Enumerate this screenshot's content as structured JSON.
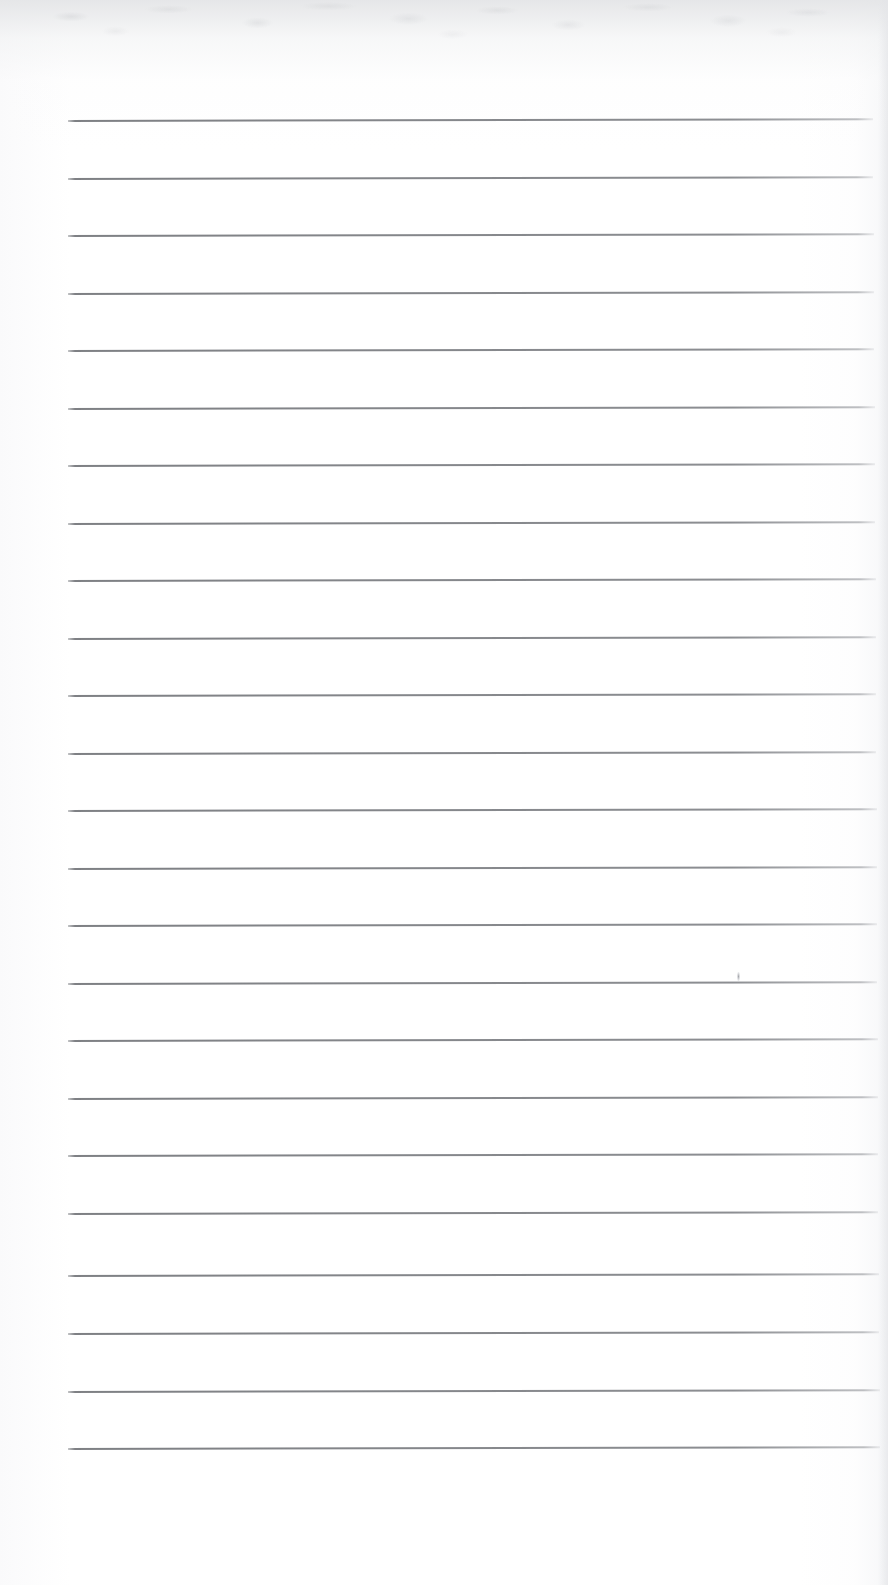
{
  "document": {
    "kind": "scanned-blank-ruled-notepad-page",
    "page_width": 888,
    "page_height": 1585,
    "background_color": "#ffffff",
    "text_content": "",
    "visible_text_present": false
  },
  "ruling": {
    "line_color": "#85878b",
    "line_thickness_px": 1.6,
    "line_count": 24,
    "left_margin_px": 68,
    "right_margin_px": 877,
    "first_line_y": 120,
    "line_spacing_px": 57.7,
    "last_line_y": 1448,
    "skew_deg": -0.12,
    "lines": [
      {
        "index": 1,
        "y": 120,
        "x1": 68,
        "x2": 873
      },
      {
        "index": 2,
        "y": 178,
        "x1": 68,
        "x2": 873
      },
      {
        "index": 3,
        "y": 235,
        "x1": 68,
        "x2": 874
      },
      {
        "index": 4,
        "y": 293,
        "x1": 68,
        "x2": 874
      },
      {
        "index": 5,
        "y": 350,
        "x1": 68,
        "x2": 874
      },
      {
        "index": 6,
        "y": 408,
        "x1": 68,
        "x2": 875
      },
      {
        "index": 7,
        "y": 465,
        "x1": 68,
        "x2": 875
      },
      {
        "index": 8,
        "y": 523,
        "x1": 68,
        "x2": 875
      },
      {
        "index": 9,
        "y": 580,
        "x1": 68,
        "x2": 876
      },
      {
        "index": 10,
        "y": 638,
        "x1": 68,
        "x2": 876
      },
      {
        "index": 11,
        "y": 695,
        "x1": 68,
        "x2": 876
      },
      {
        "index": 12,
        "y": 753,
        "x1": 68,
        "x2": 876
      },
      {
        "index": 13,
        "y": 810,
        "x1": 68,
        "x2": 877
      },
      {
        "index": 14,
        "y": 868,
        "x1": 68,
        "x2": 877
      },
      {
        "index": 15,
        "y": 925,
        "x1": 68,
        "x2": 877
      },
      {
        "index": 16,
        "y": 983,
        "x1": 68,
        "x2": 877
      },
      {
        "index": 17,
        "y": 1040,
        "x1": 68,
        "x2": 878
      },
      {
        "index": 18,
        "y": 1098,
        "x1": 68,
        "x2": 878
      },
      {
        "index": 19,
        "y": 1155,
        "x1": 68,
        "x2": 878
      },
      {
        "index": 20,
        "y": 1213,
        "x1": 68,
        "x2": 878
      },
      {
        "index": 21,
        "y": 1275,
        "x1": 68,
        "x2": 879
      },
      {
        "index": 22,
        "y": 1333,
        "x1": 68,
        "x2": 879
      },
      {
        "index": 23,
        "y": 1391,
        "x1": 68,
        "x2": 880
      },
      {
        "index": 24,
        "y": 1448,
        "x1": 68,
        "x2": 880
      }
    ]
  },
  "artifacts": {
    "top_scan_noise": {
      "present": true,
      "y_start": 0,
      "y_end": 104,
      "tone": "#b8babe"
    },
    "specks": [
      {
        "x": 737,
        "y": 972,
        "width": 3,
        "height": 9,
        "tone": "#96989e"
      }
    ],
    "bottom_blank_margin_px": 137
  }
}
